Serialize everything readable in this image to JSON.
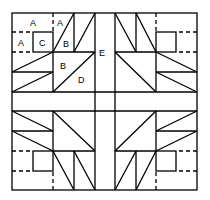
{
  "diagram": {
    "type": "quilt-block",
    "labels": {
      "a1": "A",
      "a2": "A",
      "a3": "A",
      "c": "C",
      "b1": "B",
      "b2": "B",
      "d": "D",
      "e": "E"
    },
    "stroke_color": "#000000",
    "background": "#ffffff"
  }
}
